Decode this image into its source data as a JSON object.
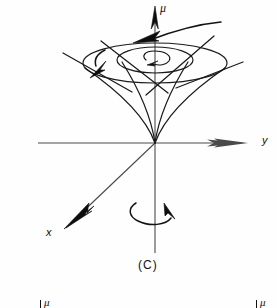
{
  "figure": {
    "caption": "(C)",
    "background_color": "#fefefe",
    "ink_color": "#131313",
    "axis_color": "#4a4a4a"
  },
  "labels": {
    "mu_top": "μ",
    "y_axis": "y",
    "x_axis": "x"
  },
  "axes": [
    {
      "name": "y-axis",
      "label": "y",
      "direction": "right",
      "origin": [
        155,
        143
      ],
      "end": [
        237,
        143
      ],
      "label_position": [
        262,
        136
      ],
      "has_arrowhead": true
    },
    {
      "name": "x-axis",
      "label": "x",
      "direction": "down-left",
      "origin": [
        155,
        143
      ],
      "end": [
        70,
        224
      ],
      "label_position": [
        48,
        228
      ],
      "has_arrowhead": true
    },
    {
      "name": "z-axis-mu",
      "label": "μ",
      "direction": "up",
      "origin": [
        155,
        143
      ],
      "end": [
        155,
        12
      ],
      "label_position": [
        161,
        3
      ],
      "has_arrowhead": true
    },
    {
      "name": "z-axis-lower",
      "label": "",
      "direction": "down",
      "origin": [
        155,
        143
      ],
      "end": [
        155,
        253
      ],
      "has_arrowhead": false
    }
  ],
  "cone": {
    "apex": [
      155,
      143
    ],
    "outer_ellipse": {
      "cx": 155,
      "cy": 63,
      "rx": 72,
      "ry": 20
    },
    "inner_ellipse": {
      "cx": 155,
      "cy": 60,
      "rx": 38,
      "ry": 13
    },
    "generator_line_count": 4
  },
  "annotations": [
    {
      "name": "precession-arrow-outer",
      "type": "curved-arrow",
      "direction": "counterclockwise",
      "location": "upper-right sweeping to left above cone"
    },
    {
      "name": "precession-arrow-left",
      "type": "curved-arrow",
      "direction": "counterclockwise",
      "location": "left rim of cone"
    },
    {
      "name": "spin-spiral-arrow",
      "type": "spiral-arrow",
      "direction": "clockwise",
      "location": "center of inner ellipse"
    },
    {
      "name": "rotation-arrow-bottom",
      "type": "circular-arrow",
      "direction": "clockwise",
      "location": "around lower z axis"
    }
  ],
  "partial_labels_bottom": [
    {
      "name": "partial-mu-left",
      "text": "μ",
      "position": [
        42,
        292
      ]
    },
    {
      "name": "partial-mu-right",
      "text": "μ",
      "position": [
        258,
        292
      ]
    }
  ]
}
